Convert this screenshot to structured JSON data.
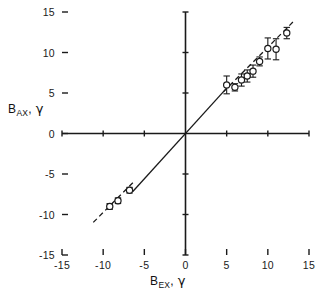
{
  "figure": {
    "width": 316,
    "height": 295,
    "background": "#ffffff",
    "ink_color": "#1a1a1a"
  },
  "axes": {
    "x_title_main": "B",
    "x_title_sub": "EX",
    "x_title_unit": "γ",
    "x_title_full": "B_EX, γ",
    "y_title_main": "B",
    "y_title_sub": "AX",
    "y_title_unit": "γ",
    "y_title_full": "B_AX, γ",
    "x_ticks": [
      "-15",
      "-10",
      "-5",
      "0",
      "5",
      "10",
      "15"
    ],
    "y_ticks": [
      "15",
      "10",
      "5",
      "0",
      "-5",
      "-10",
      "-15"
    ],
    "x_tick_values": [
      -15,
      -10,
      -5,
      0,
      5,
      10,
      15
    ],
    "y_tick_values": [
      15,
      10,
      5,
      0,
      -5,
      -10,
      -15
    ]
  },
  "chart_data": {
    "type": "scatter",
    "title": "",
    "subtitle": "",
    "xlabel": "B_EX, γ",
    "ylabel": "B_AX, γ",
    "xlim": [
      -15,
      15
    ],
    "ylim": [
      -15,
      15
    ],
    "grid": false,
    "legend": null,
    "axis_style": "centered-cross-with-outward-ticks",
    "marker": "open-circle",
    "error_bars": "vertical",
    "series": [
      {
        "name": "B_AX measurements",
        "marker": "open-circle",
        "points": [
          {
            "x": -9.2,
            "y": -9.0,
            "yerr": 0.35
          },
          {
            "x": -8.2,
            "y": -8.3,
            "yerr": 0.35
          },
          {
            "x": -6.8,
            "y": -7.0,
            "yerr": 0.35
          },
          {
            "x": 5.0,
            "y": 6.0,
            "yerr": 1.1
          },
          {
            "x": 6.0,
            "y": 5.7,
            "yerr": 0.45
          },
          {
            "x": 6.8,
            "y": 6.6,
            "yerr": 0.75
          },
          {
            "x": 7.5,
            "y": 7.1,
            "yerr": 0.75
          },
          {
            "x": 8.2,
            "y": 7.7,
            "yerr": 0.75
          },
          {
            "x": 9.0,
            "y": 8.9,
            "yerr": 0.55
          },
          {
            "x": 10.0,
            "y": 10.5,
            "yerr": 1.3
          },
          {
            "x": 11.0,
            "y": 10.4,
            "yerr": 1.3
          },
          {
            "x": 12.3,
            "y": 12.4,
            "yerr": 0.7
          }
        ]
      }
    ],
    "lines": [
      {
        "name": "solid-reference-line",
        "style": "solid",
        "slope": 1.12,
        "intercept": 0.0,
        "x_start": -6.4,
        "x_end": 5.0
      },
      {
        "name": "dashed-trend-upper",
        "style": "dashed",
        "slope": 1.02,
        "intercept": 0.45,
        "x_start": 4.6,
        "x_end": 13.2
      },
      {
        "name": "dashed-trend-lower",
        "style": "dashed",
        "slope": 1.02,
        "intercept": 0.45,
        "x_start": -11.2,
        "x_end": -6.3
      }
    ]
  }
}
